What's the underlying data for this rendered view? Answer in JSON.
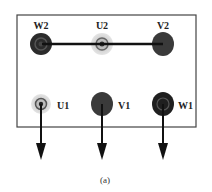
{
  "diagram": {
    "caption": "(a)",
    "box": {
      "x": 17,
      "y": 15,
      "width": 179,
      "height": 112,
      "stroke": "#444444"
    },
    "terminals_top": [
      {
        "id": "W2",
        "label": "W2",
        "cx": 41,
        "cy": 44,
        "fill": "#2b2b2b",
        "ring": "#555555"
      },
      {
        "id": "U2",
        "label": "U2",
        "cx": 102,
        "cy": 44,
        "fill": "#cfcfcf",
        "ring": "#777777"
      },
      {
        "id": "V2",
        "label": "V2",
        "cx": 163,
        "cy": 44,
        "fill": "#3a3a3a",
        "ring": "#3a3a3a"
      }
    ],
    "terminals_bottom": [
      {
        "id": "U1",
        "label": "U1",
        "cx": 41,
        "cy": 104,
        "fill": "#cfcfcf",
        "ring": "#666666"
      },
      {
        "id": "V1",
        "label": "V1",
        "cx": 102,
        "cy": 104,
        "fill": "#3a3a3a",
        "ring": "#3a3a3a"
      },
      {
        "id": "W1",
        "label": "W1",
        "cx": 163,
        "cy": 104,
        "fill": "#1f1f1f",
        "ring": "#555555"
      }
    ],
    "bridge": {
      "from": "W2",
      "to": "V2",
      "label": "star point link"
    },
    "arrows": [
      {
        "from": "U1",
        "direction": "down"
      },
      {
        "from": "V1",
        "direction": "down"
      },
      {
        "from": "W1",
        "direction": "down"
      }
    ]
  }
}
